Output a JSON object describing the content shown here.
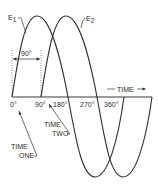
{
  "diagram": {
    "title": "",
    "type": "phase-shifted sine waves",
    "curves": [
      {
        "name": "E1",
        "label_main": "E",
        "label_sub": "1",
        "start_deg": 0
      },
      {
        "name": "E2",
        "label_main": "E",
        "label_sub": "2",
        "start_deg": 90
      }
    ],
    "phase_difference_label": "90°",
    "axis": {
      "ticks": [
        "0°",
        "90°",
        "180°",
        "270°",
        "360°"
      ],
      "direction_label": "TIME"
    },
    "annotations": {
      "time_one": [
        "TIME",
        "ONE"
      ],
      "time_two": [
        "TIME",
        "TWO"
      ]
    },
    "colors": {
      "line": "#2e2e2e",
      "background": "#ffffff"
    }
  }
}
